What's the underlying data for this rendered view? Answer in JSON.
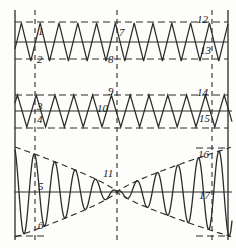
{
  "figure": {
    "type": "patent-waveform-diagram",
    "background_color": "#fdfdfb",
    "stroke_color": "#2b2b2b",
    "frame": {
      "left_axis_x": 15,
      "right_axis_x": 228,
      "top_y": 10,
      "bottom_y": 240
    },
    "vertical_markers": [
      {
        "name": "marker-left",
        "x": 35,
        "style": "dashed"
      },
      {
        "name": "marker-center",
        "x": 117,
        "style": "dashed"
      },
      {
        "name": "marker-right",
        "x": 212,
        "style": "dashed"
      }
    ],
    "horizontal_lines": [
      {
        "name": "panel1-upper-bound",
        "y": 22,
        "style": "dashed"
      },
      {
        "name": "panel1-zero-axis",
        "y": 42,
        "style": "solid"
      },
      {
        "name": "panel1-lower-bound",
        "y": 59,
        "style": "dashed"
      },
      {
        "name": "panel2-upper-bound",
        "y": 95,
        "style": "dashed"
      },
      {
        "name": "panel2-zero-axis",
        "y": 111,
        "style": "solid"
      },
      {
        "name": "panel2-lower-bound",
        "y": 128,
        "style": "dashed"
      },
      {
        "name": "panel3-zero-axis",
        "y": 192,
        "style": "solid"
      }
    ]
  },
  "panels": [
    {
      "name": "panel-triangle-wave-upper",
      "waveform": "triangle",
      "baseline_y": 42,
      "amplitude": 19,
      "period": 18.8,
      "phase_offset": 3,
      "start_x": 15,
      "end_x": 228
    },
    {
      "name": "panel-triangle-wave-lower",
      "waveform": "triangle",
      "baseline_y": 111,
      "amplitude": 16,
      "period": 18.8,
      "phase_offset": 7,
      "start_x": 15,
      "end_x": 232
    },
    {
      "name": "panel-modulated-sine",
      "waveform": "amplitude-modulated-sine",
      "baseline_y": 192,
      "max_amplitude": 45,
      "node_x": 117,
      "start_x": 15,
      "end_x": 232,
      "envelope_style": "dashed",
      "envelope_name": "bowtie-envelope"
    }
  ],
  "reference_labels": [
    {
      "id": "1",
      "text": "1",
      "x": 38,
      "y": 26
    },
    {
      "id": "2",
      "text": "2",
      "x": 37,
      "y": 54
    },
    {
      "id": "3",
      "text": "3",
      "x": 37,
      "y": 101
    },
    {
      "id": "4",
      "text": "4",
      "x": 37,
      "y": 114
    },
    {
      "id": "5",
      "text": "5",
      "x": 38,
      "y": 181
    },
    {
      "id": "6",
      "text": "6",
      "x": 38,
      "y": 220
    },
    {
      "id": "7",
      "text": "7",
      "x": 119,
      "y": 27
    },
    {
      "id": "8",
      "text": "8",
      "x": 108,
      "y": 54
    },
    {
      "id": "9",
      "text": "9",
      "x": 108,
      "y": 86
    },
    {
      "id": "10",
      "text": "10",
      "x": 97,
      "y": 103
    },
    {
      "id": "11",
      "text": "11",
      "x": 103,
      "y": 168
    },
    {
      "id": "12",
      "text": "12",
      "x": 197,
      "y": 14
    },
    {
      "id": "13",
      "text": "13",
      "x": 200,
      "y": 45
    },
    {
      "id": "14",
      "text": "14",
      "x": 197,
      "y": 87
    },
    {
      "id": "15",
      "text": "15",
      "x": 199,
      "y": 113
    },
    {
      "id": "16",
      "text": "16",
      "x": 198,
      "y": 149
    },
    {
      "id": "17",
      "text": "17",
      "x": 199,
      "y": 190
    }
  ]
}
